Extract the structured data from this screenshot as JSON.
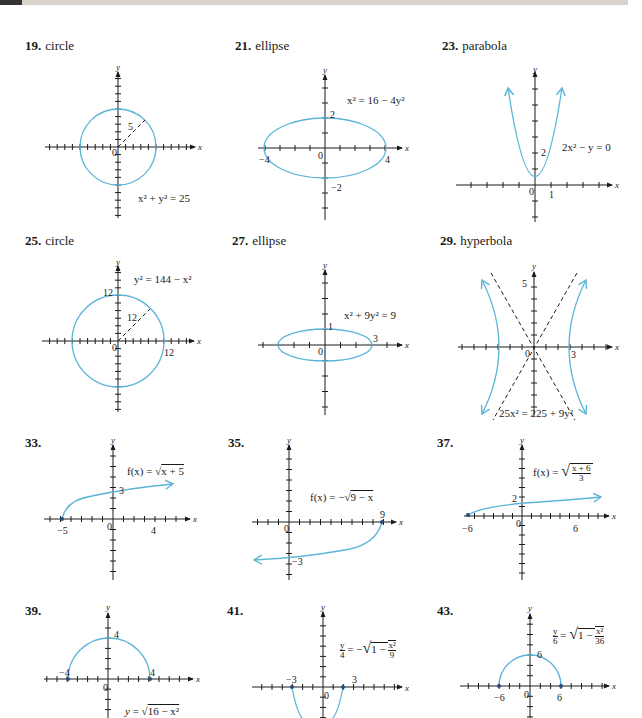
{
  "page": {
    "type": "textbook answer key page (conic sections / radical function graphs)"
  },
  "colors": {
    "curve": "#5bb5d8",
    "axis": "#1a1a1a",
    "asymptote": "#1a1a1a"
  },
  "panels": [
    {
      "id": "19",
      "number": "19.",
      "label": "circle",
      "equation": "x² + y² = 25",
      "labels": {
        "radius": "5",
        "origin": "0"
      }
    },
    {
      "id": "21",
      "number": "21.",
      "label": "ellipse",
      "equation": "x² = 16 − 4y²",
      "labels": {
        "x_neg": "−4",
        "x_pos": "4",
        "y_pos": "2",
        "y_neg": "−2",
        "origin": "0"
      }
    },
    {
      "id": "23",
      "number": "23.",
      "label": "parabola",
      "equation": "2x² − y = 0",
      "labels": {
        "y_tick": "2",
        "x_tick": "1",
        "origin": "0"
      }
    },
    {
      "id": "25",
      "number": "25.",
      "label": "circle",
      "equation": "y² = 144 − x²",
      "labels": {
        "y_top": "12",
        "radius": "12",
        "x_right": "12",
        "origin": "0"
      }
    },
    {
      "id": "27",
      "number": "27.",
      "label": "ellipse",
      "equation": "x² + 9y² = 9",
      "labels": {
        "y_top": "1",
        "x_right": "3",
        "origin": "0"
      }
    },
    {
      "id": "29",
      "number": "29.",
      "label": "hyperbola",
      "equation": "25x² = 225 + 9y²",
      "labels": {
        "y_top": "5",
        "x_right": "3",
        "origin": "0"
      }
    },
    {
      "id": "33",
      "number": "33.",
      "label": "",
      "equation": "f(x) = √x + 5",
      "labels": {
        "x_neg": "−5",
        "x_pos": "4",
        "y_tick": "3",
        "origin": "0"
      }
    },
    {
      "id": "35",
      "number": "35.",
      "label": "",
      "equation": "f(x) = −√9 − x",
      "labels": {
        "x_pos": "9",
        "y_neg": "−3",
        "origin": "0"
      }
    },
    {
      "id": "37",
      "number": "37.",
      "label": "",
      "equation": "f(x) = √((x + 6)/3)",
      "labels": {
        "x_neg": "−6",
        "x_pos": "6",
        "y_tick": "2",
        "origin": "0"
      }
    },
    {
      "id": "39",
      "number": "39.",
      "label": "",
      "equation": "y = √16 − x²",
      "labels": {
        "x_neg": "−4",
        "x_pos": "4",
        "y_top": "4",
        "origin": "0"
      }
    },
    {
      "id": "41",
      "number": "41.",
      "label": "",
      "equation": "y/4 = −√(1 − x²/9)",
      "labels": {
        "x_neg": "−3",
        "x_pos": "3",
        "origin": "0"
      }
    },
    {
      "id": "43",
      "number": "43.",
      "label": "",
      "equation": "y/6 = √(1 − x²/36)",
      "labels": {
        "x_neg": "−6",
        "x_pos": "6",
        "y_top": "6",
        "origin": "0"
      }
    }
  ],
  "axis_names": {
    "x": "x",
    "y": "y"
  },
  "eq_parts": {
    "p33_lhs": "f(x) = ",
    "p33_rad": "x + 5",
    "p35_lhs": "f(x) = −",
    "p35_rad": "9 − x",
    "p37_lhs": "f(x) = ",
    "p37_num": "x + 6",
    "p37_den": "3",
    "p39_lhs": "y = ",
    "p39_rad": "16 − x²",
    "p41_lhs_num": "y",
    "p41_lhs_den": "4",
    "p41_mid": " = −",
    "p41_rad_a": "1 − ",
    "p41_num": "x²",
    "p41_den": "9",
    "p43_lhs_num": "y",
    "p43_lhs_den": "6",
    "p43_mid": " = ",
    "p43_rad_a": "1 − ",
    "p43_num": "x²",
    "p43_den": "36"
  }
}
